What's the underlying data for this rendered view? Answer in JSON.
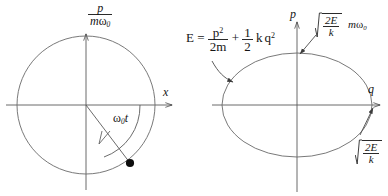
{
  "figure": {
    "background_color": "#ffffff",
    "ink_color": "#3c3c3c",
    "text_color": "#151515",
    "width": 388,
    "height": 196
  },
  "left_diagram": {
    "name": "circular-phase-trajectory",
    "shape": "circle",
    "center": {
      "x": 86,
      "y": 105
    },
    "radius": 69,
    "vertical_axis_label": {
      "numerator": "p",
      "denominator_m": "m",
      "denominator_omega": "ω",
      "denominator_omega_sub": "0"
    },
    "horizontal_axis_label": "x",
    "angle_label": {
      "omega": "ω",
      "sub": "0",
      "t": "t"
    },
    "point_marker": {
      "name": "state-point",
      "x": 130,
      "y": 163
    }
  },
  "right_diagram": {
    "name": "elliptical-phase-trajectory",
    "shape": "ellipse",
    "center": {
      "x": 297,
      "y": 105
    },
    "semi_axis_x": 75,
    "semi_axis_y": 52,
    "vertical_axis_label": "p",
    "horizontal_axis_label": "q",
    "energy_equation": {
      "lhs": "E",
      "equals": "=",
      "term1_num": "p",
      "term1_num_sup": "2",
      "term1_den": "2m",
      "plus": "+",
      "term2_num": "1",
      "term2_den": "2",
      "term2_k": "k",
      "term2_q": "q",
      "term2_q_sup": "2"
    },
    "momentum_amplitude_label": {
      "radical_num": "2E",
      "radical_den": "k",
      "factor_m": "m",
      "factor_omega": "ω",
      "factor_omega_sub": "0"
    },
    "position_amplitude_label": {
      "radical_num": "2E",
      "radical_den": "k"
    }
  }
}
